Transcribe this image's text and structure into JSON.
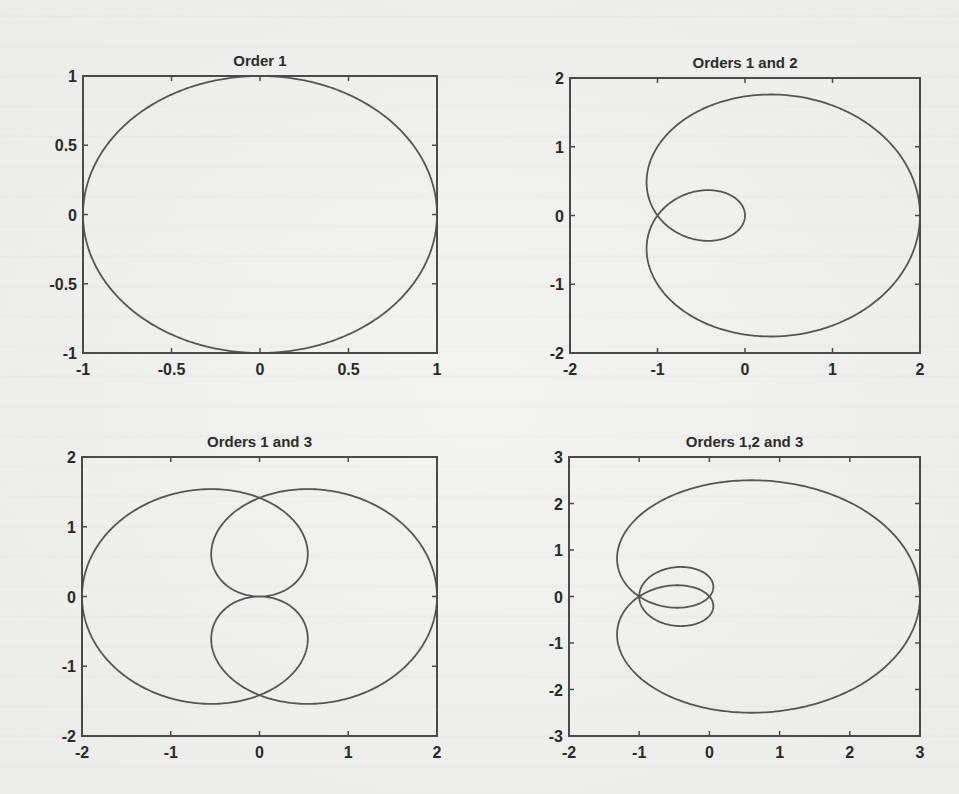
{
  "figure": {
    "background_color": "#efefed",
    "line_color": "#555555",
    "axis_color": "#4a4a4a"
  },
  "chart_data": [
    {
      "type": "line",
      "title": "Order 1",
      "orders": [
        1
      ],
      "equation": "z(t) = e^{it}",
      "xlabel": "",
      "ylabel": "",
      "xlim": [
        -1,
        1
      ],
      "ylim": [
        -1,
        1
      ],
      "xticks": [
        -1,
        -0.5,
        0,
        0.5,
        1
      ],
      "xtick_labels": [
        "-1",
        "-0.5",
        "0",
        "0.5",
        "1"
      ],
      "yticks": [
        -1,
        -0.5,
        0,
        0.5,
        1
      ],
      "ytick_labels": [
        "-1",
        "-0.5",
        "0",
        "0.5",
        "1"
      ],
      "grid": false,
      "frame": {
        "left": 83,
        "top": 76,
        "right": 437,
        "bottom": 353
      }
    },
    {
      "type": "line",
      "title": "Orders 1 and 2",
      "orders": [
        1,
        2
      ],
      "equation": "z(t) = e^{it} + e^{2it}",
      "xlabel": "",
      "ylabel": "",
      "xlim": [
        -2,
        2
      ],
      "ylim": [
        -2,
        2
      ],
      "xticks": [
        -2,
        -1,
        0,
        1,
        2
      ],
      "xtick_labels": [
        "-2",
        "-1",
        "0",
        "1",
        "2"
      ],
      "yticks": [
        -2,
        -1,
        0,
        1,
        2
      ],
      "ytick_labels": [
        "-2",
        "-1",
        "0",
        "1",
        "2"
      ],
      "grid": false,
      "frame": {
        "left": 570,
        "top": 78,
        "right": 920,
        "bottom": 353
      }
    },
    {
      "type": "line",
      "title": "Orders 1 and 3",
      "orders": [
        1,
        3
      ],
      "equation": "z(t) = e^{it} + e^{3it}",
      "xlabel": "",
      "ylabel": "",
      "xlim": [
        -2,
        2
      ],
      "ylim": [
        -2,
        2
      ],
      "xticks": [
        -2,
        -1,
        0,
        1,
        2
      ],
      "xtick_labels": [
        "-2",
        "-1",
        "0",
        "1",
        "2"
      ],
      "yticks": [
        -2,
        -1,
        0,
        1,
        2
      ],
      "ytick_labels": [
        "-2",
        "-1",
        "0",
        "1",
        "2"
      ],
      "grid": false,
      "frame": {
        "left": 82,
        "top": 457,
        "right": 437,
        "bottom": 736
      }
    },
    {
      "type": "line",
      "title": "Orders 1,2 and 3",
      "orders": [
        1,
        2,
        3
      ],
      "equation": "z(t) = e^{it} + e^{2it} + e^{3it}",
      "xlabel": "",
      "ylabel": "",
      "xlim": [
        -2,
        3
      ],
      "ylim": [
        -3,
        3
      ],
      "xticks": [
        -2,
        -1,
        0,
        1,
        2,
        3
      ],
      "xtick_labels": [
        "-2",
        "-1",
        "0",
        "1",
        "2",
        "3"
      ],
      "yticks": [
        -3,
        -2,
        -1,
        0,
        1,
        2,
        3
      ],
      "ytick_labels": [
        "-3",
        "-2",
        "-1",
        "0",
        "1",
        "2",
        "3"
      ],
      "grid": false,
      "frame": {
        "left": 569,
        "top": 457,
        "right": 920,
        "bottom": 736
      }
    }
  ]
}
